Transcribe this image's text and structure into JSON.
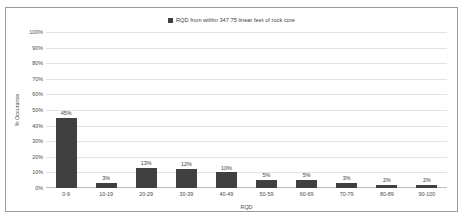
{
  "chart_data": {
    "type": "bar",
    "title": "",
    "legend": [
      {
        "label": "RQD from within 347.75 linear feet of rock core",
        "color": "#404040"
      }
    ],
    "legend_position": "top-center",
    "categories": [
      "0-9",
      "10-19",
      "20-29",
      "30-39",
      "40-49",
      "50-59",
      "60-69",
      "70-79",
      "80-89",
      "90-100"
    ],
    "values": [
      45,
      3,
      13,
      12,
      10,
      5,
      5,
      3,
      2,
      2
    ],
    "value_labels": [
      "45%",
      "3%",
      "13%",
      "12%",
      "10%",
      "5%",
      "5%",
      "3%",
      "2%",
      "2%"
    ],
    "xlabel": "RQD",
    "ylabel": "% Occurance",
    "ylim": [
      0,
      100
    ],
    "ytick_labels": [
      "100%",
      "90%",
      "80%",
      "70%",
      "60%",
      "50%",
      "40%",
      "30%",
      "20%",
      "10%",
      "0%"
    ],
    "ytick_values": [
      100,
      90,
      80,
      70,
      60,
      50,
      40,
      30,
      20,
      10,
      0
    ],
    "grid": true,
    "grid_color": "#e2e2e2",
    "bar_color": "#404040",
    "border_color": "#9a9a9a",
    "background": "#ffffff"
  }
}
